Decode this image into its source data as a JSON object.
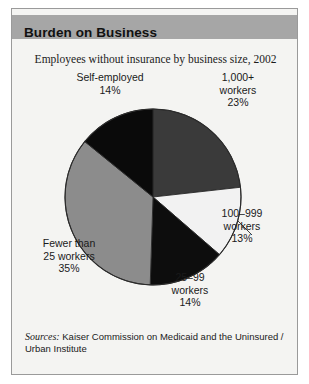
{
  "figure": {
    "title": "Burden on Business",
    "subtitle": "Employees without insurance by business size, 2002",
    "source_label": "Sources:",
    "source_text": " Kaiser Commission on Medicaid and the Uninsured / Urban Institute"
  },
  "colors": {
    "title_band": "#a6a6a6",
    "background": "#f4f4f2",
    "slice_1000plus": "#3a3a3a",
    "slice_100_999": "#f2f2f2",
    "slice_25_99": "#0d0d0d",
    "slice_fewer_25": "#8c8c8c",
    "slice_self_employed": "#0a0a0a",
    "outline": "#2b2b2b"
  },
  "labels": {
    "self_employed": "Self-employed\n14%",
    "thousand_plus": "1,000+\nworkers\n23%",
    "hundred_999": "100–999\nworkers\n13%",
    "twentyfive_99": "25–99\nworkers\n14%",
    "fewer_25": "Fewer than\n25 workers\n35%"
  },
  "chart_data": {
    "type": "pie",
    "title": "Burden on Business",
    "subtitle": "Employees without insurance by business size, 2002",
    "xlabel": "",
    "ylabel": "",
    "units": "percent",
    "total": 99,
    "start_angle_deg": 0,
    "direction": "clockwise",
    "legend": "none (direct labels)",
    "grid": false,
    "categories": [
      "1,000+ workers",
      "100–999 workers",
      "25–99 workers",
      "Fewer than 25 workers",
      "Self-employed"
    ],
    "values": [
      23,
      13,
      14,
      35,
      14
    ],
    "slices": [
      {
        "label": "1,000+ workers",
        "value": 23,
        "color": "#3a3a3a",
        "label_text": "1,000+\nworkers\n23%"
      },
      {
        "label": "100–999 workers",
        "value": 13,
        "color": "#f2f2f2",
        "label_text": "100–999\nworkers\n13%"
      },
      {
        "label": "25–99 workers",
        "value": 14,
        "color": "#0d0d0d",
        "label_text": "25–99\nworkers\n14%"
      },
      {
        "label": "Fewer than 25 workers",
        "value": 35,
        "color": "#8c8c8c",
        "label_text": "Fewer than\n25 workers\n35%"
      },
      {
        "label": "Self-employed",
        "value": 14,
        "color": "#0a0a0a",
        "label_text": "Self-employed\n14%"
      }
    ],
    "annotations": [
      "Sources: Kaiser Commission on Medicaid and the Uninsured / Urban Institute"
    ]
  }
}
